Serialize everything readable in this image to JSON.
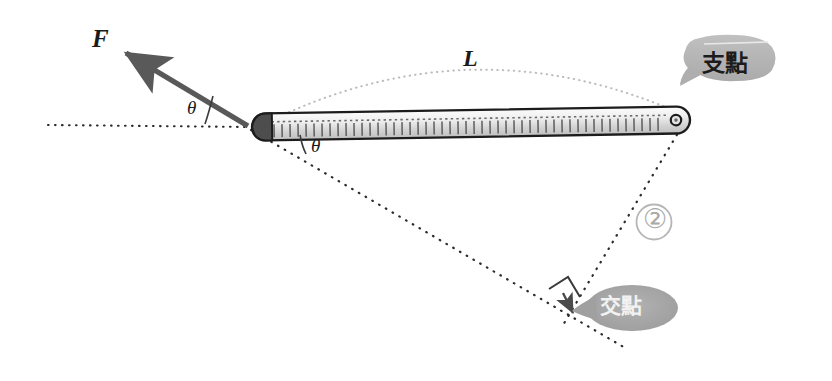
{
  "diagram": {
    "labels": {
      "force": "F",
      "length": "L",
      "angle_1": "θ",
      "angle_2": "θ",
      "circled_number": "②"
    },
    "callouts": [
      {
        "id": "fulcrum",
        "text": "支點",
        "meaning": "fulcrum",
        "bubble_fill": "#b4b4b4",
        "text_color": "#1c1c1c",
        "tail_direction": "down-left"
      },
      {
        "id": "intersection",
        "text": "交點",
        "meaning": "intersection point",
        "bubble_fill": "#a8a8a8",
        "text_color": "#f2f2f2",
        "tail_direction": "left"
      }
    ],
    "elements": {
      "force_arrow": {
        "name": "force-arrow",
        "color": "#595959",
        "from": [
          248,
          126
        ],
        "to": [
          118,
          48
        ]
      },
      "lever_bar": {
        "name": "lever-bar",
        "fill_light": "#f2f2f2",
        "fill_dark": "#c8c8c8",
        "outline": "#1c1c1c",
        "left_end": [
          252,
          127
        ],
        "right_end": [
          688,
          120
        ],
        "pivot_hole": [
          678,
          123
        ]
      },
      "horizontal_dotted_line": {
        "name": "horizontal-reference-line",
        "from": [
          48,
          125
        ],
        "to": [
          248,
          127
        ],
        "color": "#2b2b2b"
      },
      "length_arc": {
        "name": "length-arc-L",
        "from": [
          262,
          126
        ],
        "to": [
          683,
          118
        ],
        "color": "#b9b9b9"
      },
      "perpendicular_line": {
        "name": "perpendicular-drop-line",
        "from": [
          250,
          128
        ],
        "to": [
          625,
          348
        ],
        "color": "#2b2b2b"
      },
      "fulcrum_line": {
        "name": "fulcrum-to-intersection-line",
        "from": [
          678,
          124
        ],
        "to": [
          560,
          322
        ],
        "color": "#2b2b2b"
      },
      "right_angle_marker": {
        "name": "right-angle-marker",
        "color": "#2b2b2b"
      },
      "intersection_arrow": {
        "name": "intersection-arrowhead",
        "at": [
          572,
          312
        ],
        "color": "#4a4a4a"
      }
    },
    "colors": {
      "background": "#ffffff",
      "ink": "#1c1c1c",
      "dotted": "#2b2b2b",
      "faint": "#b9b9b9",
      "bubble_gray": "#b0b0b0"
    }
  }
}
